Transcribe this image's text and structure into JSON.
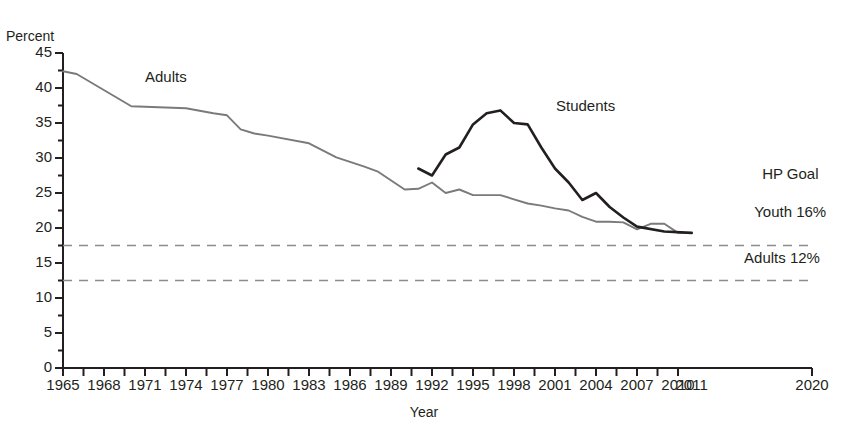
{
  "figure": {
    "y_axis_title": "Percent",
    "x_axis_title": "Year"
  },
  "y_ticks": [
    "0",
    "5",
    "10",
    "15",
    "20",
    "25",
    "30",
    "35",
    "40",
    "45"
  ],
  "x_ticks": [
    "1965",
    "1968",
    "1971",
    "1974",
    "1977",
    "1980",
    "1983",
    "1986",
    "1989",
    "1992",
    "1995",
    "1998",
    "2001",
    "2004",
    "2007",
    "2010",
    "2011",
    "2020"
  ],
  "series_labels": {
    "adults": "Adults",
    "students": "Students"
  },
  "annotations": {
    "hp_goal_line1": "HP Goal",
    "hp_goal_line2": "Youth 16%",
    "adults_goal": "Adults 12%"
  },
  "colors": {
    "adults_line": "#7a7a7a",
    "students_line": "#231f20",
    "goal_line": "#8c8c8c",
    "axis": "#231f20",
    "background": "#ffffff"
  },
  "chart_data": {
    "type": "line",
    "title": "",
    "xlabel": "Year",
    "ylabel": "Percent",
    "xlim": [
      1965,
      2020
    ],
    "ylim": [
      0,
      45
    ],
    "grid": false,
    "legend": "inline-labels",
    "x_tick_values": [
      1965,
      1968,
      1971,
      1974,
      1977,
      1980,
      1983,
      1986,
      1989,
      1992,
      1995,
      1998,
      2001,
      2004,
      2007,
      2010,
      2011,
      2020
    ],
    "y_tick_values": [
      0,
      5,
      10,
      15,
      20,
      25,
      30,
      35,
      40,
      45
    ],
    "y_minor_tick_step": 2.5,
    "series": [
      {
        "name": "Adults",
        "color": "#7a7a7a",
        "points": [
          [
            1965,
            42.4
          ],
          [
            1966,
            42.0
          ],
          [
            1970,
            37.4
          ],
          [
            1974,
            37.1
          ],
          [
            1976,
            36.4
          ],
          [
            1977,
            36.1
          ],
          [
            1978,
            34.1
          ],
          [
            1979,
            33.5
          ],
          [
            1980,
            33.2
          ],
          [
            1983,
            32.1
          ],
          [
            1985,
            30.1
          ],
          [
            1987,
            28.8
          ],
          [
            1988,
            28.1
          ],
          [
            1990,
            25.5
          ],
          [
            1991,
            25.6
          ],
          [
            1992,
            26.5
          ],
          [
            1993,
            25.0
          ],
          [
            1994,
            25.5
          ],
          [
            1995,
            24.7
          ],
          [
            1997,
            24.7
          ],
          [
            1998,
            24.1
          ],
          [
            1999,
            23.5
          ],
          [
            2000,
            23.2
          ],
          [
            2001,
            22.8
          ],
          [
            2002,
            22.5
          ],
          [
            2003,
            21.6
          ],
          [
            2004,
            20.9
          ],
          [
            2005,
            20.9
          ],
          [
            2006,
            20.8
          ],
          [
            2007,
            19.8
          ],
          [
            2008,
            20.6
          ],
          [
            2009,
            20.6
          ],
          [
            2010,
            19.3
          ],
          [
            2011,
            19.3
          ]
        ]
      },
      {
        "name": "Students",
        "color": "#231f20",
        "points": [
          [
            1991,
            28.5
          ],
          [
            1992,
            27.5
          ],
          [
            1993,
            30.5
          ],
          [
            1994,
            31.5
          ],
          [
            1995,
            34.8
          ],
          [
            1996,
            36.4
          ],
          [
            1997,
            36.8
          ],
          [
            1998,
            35.0
          ],
          [
            1999,
            34.8
          ],
          [
            2000,
            31.5
          ],
          [
            2001,
            28.5
          ],
          [
            2002,
            26.5
          ],
          [
            2003,
            24.0
          ],
          [
            2004,
            25.0
          ],
          [
            2005,
            23.0
          ],
          [
            2006,
            21.5
          ],
          [
            2007,
            20.2
          ],
          [
            2009,
            19.5
          ],
          [
            2011,
            19.3
          ]
        ]
      }
    ],
    "reference_lines": [
      {
        "label": "HP Goal Youth 16%",
        "y": 17.5,
        "style": "dashed",
        "color": "#8c8c8c"
      },
      {
        "label": "Adults 12%",
        "y": 12.5,
        "style": "dashed",
        "color": "#8c8c8c"
      }
    ]
  }
}
